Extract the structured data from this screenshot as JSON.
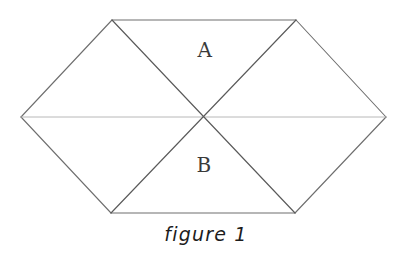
{
  "figure": {
    "caption": "figure 1",
    "background_color": "#ffffff",
    "stroke_color_diagonal": "#5a5a5a",
    "stroke_color_edge": "#6e6e6e",
    "stroke_color_midline": "#a9a9a9",
    "label_color": "#3a3a3a",
    "caption_color": "#1c1c1c",
    "regions": [
      {
        "id": "region-a",
        "label": "A",
        "position": "upper-middle"
      },
      {
        "id": "region-b",
        "label": "B",
        "position": "lower-middle"
      }
    ],
    "vertices": {
      "left": [
        21,
        117
      ],
      "top_left": [
        112,
        20
      ],
      "top_right": [
        296,
        20
      ],
      "right": [
        386,
        117
      ],
      "bottom_right": [
        295,
        213
      ],
      "bottom_left": [
        111,
        213
      ],
      "center": [
        203,
        117
      ]
    },
    "segments": [
      {
        "name": "top-edge",
        "from": "top_left",
        "to": "top_right",
        "weight": "edge"
      },
      {
        "name": "bottom-edge",
        "from": "bottom_left",
        "to": "bottom_right",
        "weight": "edge"
      },
      {
        "name": "upper-left-edge",
        "from": "left",
        "to": "top_left",
        "weight": "edge"
      },
      {
        "name": "lower-left-edge",
        "from": "left",
        "to": "bottom_left",
        "weight": "edge"
      },
      {
        "name": "upper-right-edge",
        "from": "top_right",
        "to": "right",
        "weight": "edge"
      },
      {
        "name": "lower-right-edge",
        "from": "bottom_right",
        "to": "right",
        "weight": "edge"
      },
      {
        "name": "horizontal-midline",
        "from": "left",
        "to": "right",
        "weight": "midline"
      },
      {
        "name": "diagonal-top-left-to-bottom-right",
        "from": "top_left",
        "to": "bottom_right",
        "weight": "diagonal"
      },
      {
        "name": "diagonal-bottom-left-to-top-right",
        "from": "bottom_left",
        "to": "top_right",
        "weight": "diagonal"
      }
    ]
  }
}
